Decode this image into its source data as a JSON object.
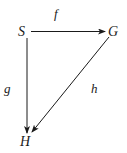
{
  "diagram": {
    "type": "commutative-triangle",
    "nodes": [
      {
        "id": "S",
        "label": "S",
        "x": 23,
        "y": 36
      },
      {
        "id": "G",
        "label": "G",
        "x": 115,
        "y": 36
      },
      {
        "id": "H",
        "label": "H",
        "x": 25,
        "y": 146
      }
    ],
    "edges": [
      {
        "from": "S",
        "to": "G",
        "label": "f"
      },
      {
        "from": "S",
        "to": "H",
        "label": "g"
      },
      {
        "from": "G",
        "to": "H",
        "label": "h"
      }
    ],
    "colors": {
      "stroke": "#1a1a1a",
      "background": "#ffffff"
    }
  }
}
